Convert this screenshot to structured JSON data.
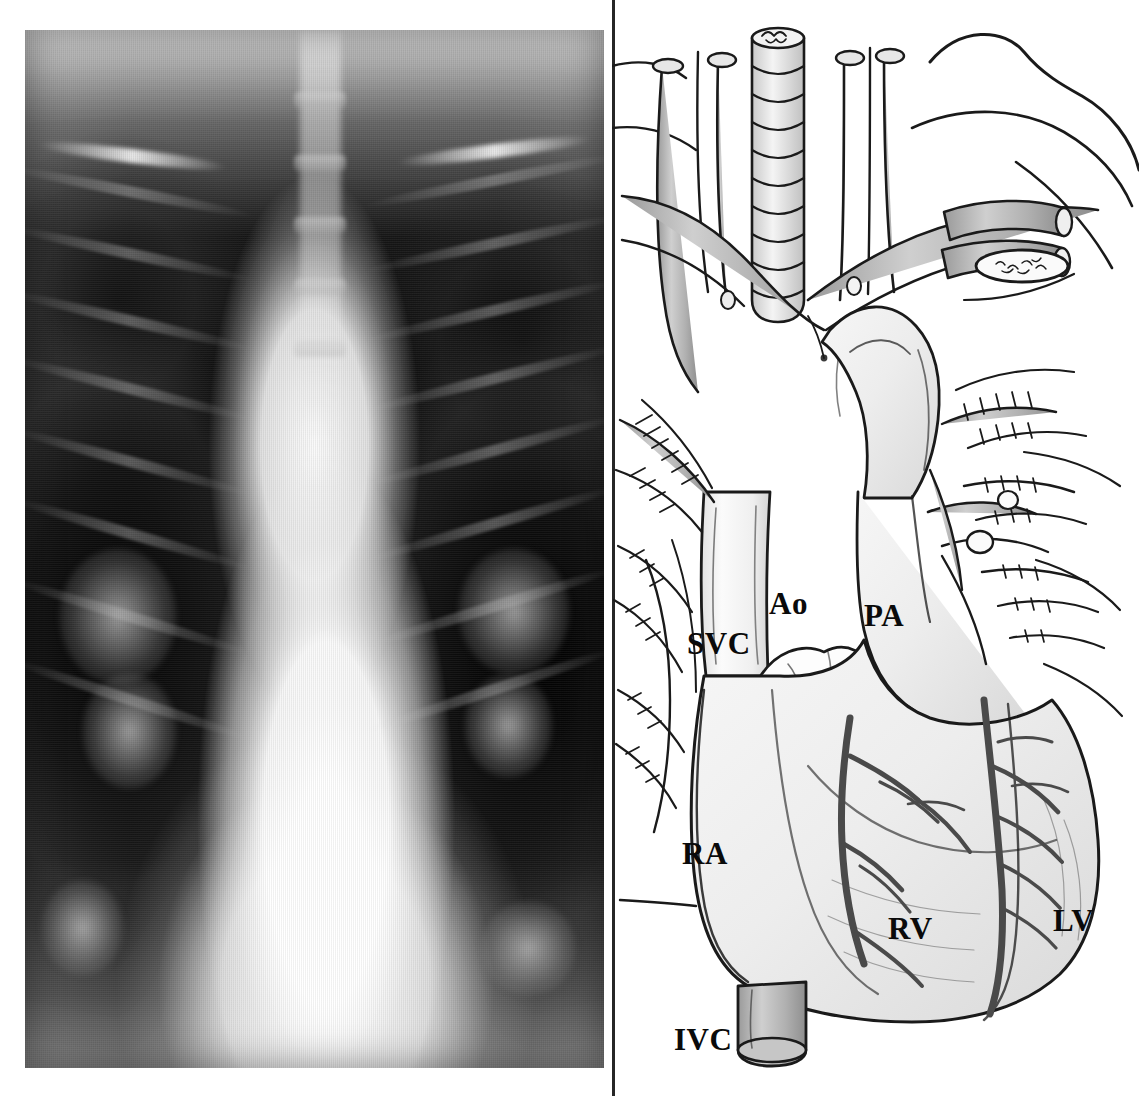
{
  "figure": {
    "type": "medical-figure-two-panel",
    "panels": [
      {
        "id": "chest-radiograph",
        "kind": "chest-x-ray",
        "view": "frontal-pa",
        "findings": "markedly widened mediastinum with dense central opacity; dark aerated lung fields laterally; rib and clavicle shadows visible",
        "position": "left"
      },
      {
        "id": "heart-anatomy-drawing",
        "kind": "line-drawing",
        "subject": "heart and great vessels with trachea, bronchi and pulmonary vasculature",
        "position": "right"
      }
    ]
  },
  "labels": {
    "svc": "SVC",
    "ao": "Ao",
    "pa": "PA",
    "ra": "RA",
    "rv": "RV",
    "lv": "LV",
    "ivc": "IVC"
  },
  "label_meanings": {
    "svc": "superior vena cava",
    "ao": "aorta",
    "pa": "pulmonary artery",
    "ra": "right atrium",
    "rv": "right ventricle",
    "lv": "left ventricle",
    "ivc": "inferior vena cava"
  },
  "colors": {
    "background": "#ffffff",
    "ink": "#1a1a1a",
    "label_text": "#0a0a0a",
    "vessel_fill": "#b9b9b9",
    "chamber_fill": "#f2f2f2",
    "xray_bright": "#fdfdfd",
    "xray_dark": "#0d0d0d"
  }
}
